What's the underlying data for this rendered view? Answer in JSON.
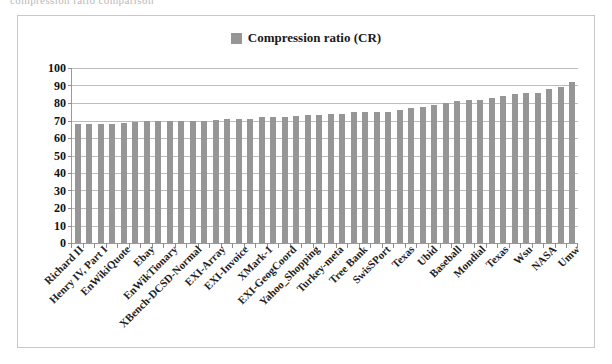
{
  "top_clipped_text": "compression ratio comparison",
  "legend": {
    "swatch_color": "#969696",
    "label": "Compression ratio (CR)"
  },
  "chart_data": {
    "type": "bar",
    "title": "",
    "subtitle": "",
    "xlabel": "",
    "ylabel": "",
    "ylim": [
      0,
      100
    ],
    "ytick_step": 10,
    "ytick_labels": [
      "100",
      "90",
      "80",
      "70",
      "60",
      "50",
      "40",
      "30",
      "20",
      "10",
      "0"
    ],
    "grid": true,
    "legend_position": "top-center",
    "series_name": "Compression ratio (CR)",
    "bar_color": "#969696",
    "categories": [
      "Richard II",
      "",
      "Henry IV, Part I",
      "",
      "EnWikiQuote",
      "",
      "Ebay",
      "",
      "EnWikTionary",
      "",
      "XBench-DCSD-Normal",
      "",
      "EXI-Array",
      "",
      "EXI-Invoice",
      "",
      "XMark-1",
      "",
      "EXI-GeogCoord",
      "",
      "Yahoo_Shopping",
      "",
      "Turkey-meta",
      "",
      "Tree Bank",
      "",
      "SwisSPort",
      "",
      "Texas",
      "",
      "Ubid",
      "",
      "Baseball",
      "",
      "Mondial",
      "",
      "Texas",
      "",
      "Wsu",
      "",
      "NASA",
      "",
      "Umw",
      ""
    ],
    "visible_tick_labels": [
      "Richard II",
      "Henry IV, Part I",
      "EnWikiQuote",
      "Ebay",
      "EnWikTionary",
      "XBench-DCSD-Normal",
      "EXI-Array",
      "EXI-Invoice",
      "XMark-1",
      "EXI-GeogCoord",
      "Yahoo_Shopping",
      "Turkey-meta",
      "Tree Bank",
      "SwisSPort",
      "Texas",
      "Ubid",
      "Baseball",
      "Mondial",
      "Texas",
      "Wsu",
      "NASA",
      "Umw"
    ],
    "values": [
      68,
      68,
      68,
      68,
      68.5,
      69,
      70,
      70,
      70,
      70,
      70,
      70,
      70.5,
      71,
      71,
      71,
      72,
      72,
      72,
      72.5,
      73,
      73,
      73.5,
      74,
      75,
      75,
      75,
      75,
      76,
      77,
      78,
      79,
      80,
      81,
      81.5,
      82,
      83,
      84,
      85,
      85.5,
      86,
      88,
      89,
      92
    ]
  }
}
